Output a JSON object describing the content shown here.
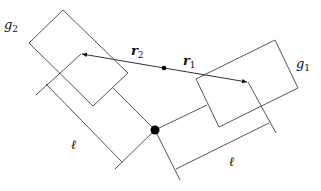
{
  "diagram": {
    "labels": {
      "g1": {
        "base": "g",
        "sub": "1"
      },
      "g2": {
        "base": "g",
        "sub": "2"
      },
      "r1": {
        "base": "r",
        "sub": "1"
      },
      "r2": {
        "base": "r",
        "sub": "2"
      },
      "ell_left": "ℓ",
      "ell_right": "ℓ"
    },
    "colors": {
      "line": "#555555",
      "dot": "#000000"
    }
  }
}
